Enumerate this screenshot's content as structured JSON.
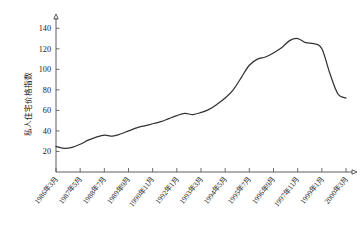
{
  "chart_data": {
    "type": "line",
    "title": "",
    "xlabel": "",
    "ylabel": "私人住宅价格指数",
    "ylim": [
      0,
      150
    ],
    "yticks": [
      20,
      40,
      60,
      80,
      100,
      120,
      140
    ],
    "ytick_labels": [
      "20",
      "40",
      "60",
      "80",
      "100",
      "120",
      "140"
    ],
    "grid": false,
    "legend": false,
    "xtick_labels": [
      "1986年3月",
      "1987年5月",
      "1988年7月",
      "1989年9月",
      "1990年11月",
      "1992年1月",
      "1993年3月",
      "1994年5月",
      "1995年7月",
      "1996年9月",
      "1997年11月",
      "1999年1月",
      "2000年3月"
    ],
    "series": [
      {
        "name": "私人住宅价格指数",
        "x": [
          "1986-03",
          "1986-08",
          "1987-01",
          "1987-05",
          "1987-10",
          "1988-03",
          "1988-07",
          "1988-12",
          "1989-05",
          "1989-09",
          "1990-02",
          "1990-07",
          "1990-11",
          "1991-04",
          "1991-09",
          "1992-01",
          "1992-06",
          "1992-11",
          "1993-03",
          "1993-08",
          "1994-01",
          "1994-05",
          "1994-10",
          "1995-03",
          "1995-07",
          "1995-12",
          "1996-05",
          "1996-09",
          "1997-02",
          "1997-07",
          "1997-11",
          "1998-04",
          "1998-09",
          "1999-01",
          "1999-06",
          "1999-11",
          "2000-03"
        ],
        "values": [
          25,
          23,
          24,
          27,
          31,
          34,
          36,
          35,
          37,
          40,
          43,
          45,
          47,
          49,
          52,
          55,
          57,
          56,
          58,
          61,
          66,
          72,
          80,
          92,
          104,
          110,
          112,
          116,
          121,
          128,
          130,
          126,
          125,
          120,
          96,
          76,
          72
        ]
      }
    ],
    "annotations": {
      "peak_value": 130,
      "peak_label": "1997年11月",
      "trough_value": 72,
      "trough_label": "1999年1月",
      "recovery_value": 98,
      "start_value": 25
    },
    "colors": {
      "line": "#333333",
      "axis": "#4a4a4a",
      "background": "#ffffff",
      "text": "#1a1a1a"
    }
  }
}
